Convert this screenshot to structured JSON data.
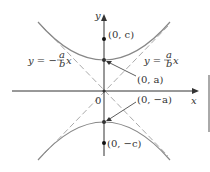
{
  "diagram": {
    "type": "hyperbola",
    "axes": {
      "x_label": "x",
      "y_label": "y",
      "origin_label": "0"
    },
    "points": [
      {
        "label": "(0, c)",
        "x": 0,
        "y": "c"
      },
      {
        "label": "(0, a)",
        "x": 0,
        "y": "a"
      },
      {
        "label": "(0, −a)",
        "x": 0,
        "y": "−a"
      },
      {
        "label": "(0, −c)",
        "x": 0,
        "y": "−c"
      }
    ],
    "asymptotes": [
      {
        "label_left": "y = −",
        "frac_num": "a",
        "frac_den": "b",
        "var": "x"
      },
      {
        "label_left": "y = ",
        "frac_num": "a",
        "frac_den": "b",
        "var": "x"
      }
    ],
    "colors": {
      "curve": "#808080",
      "axis": "#333333",
      "asymptote": "#aaaaaa"
    }
  }
}
